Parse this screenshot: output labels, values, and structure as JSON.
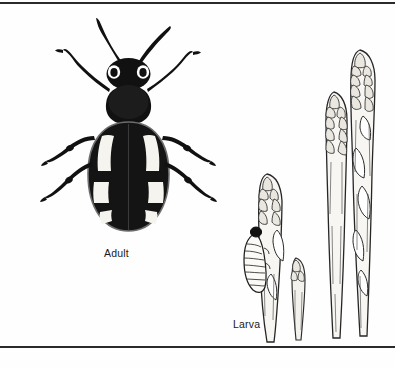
{
  "figure": {
    "background_color": "#fefefe",
    "ink_color": "#1a1a1a",
    "rule_color": "#2a2a2a",
    "panels": [
      {
        "id": "adult",
        "caption": "Adult",
        "subject": "asparagus-beetle-adult",
        "description": "Dorsal view line illustration of an adult asparagus beetle with dark body, pale blotches on the elytra, six legs and two long antennae"
      },
      {
        "id": "larva",
        "caption": "Larva",
        "subject": "asparagus-beetle-larva-on-spears",
        "description": "Line illustration of four asparagus spears with scaled tips, a grub-like beetle larva feeding on the leftmost spear"
      }
    ]
  },
  "captions": {
    "adult": "Adult",
    "larva": "Larva"
  }
}
